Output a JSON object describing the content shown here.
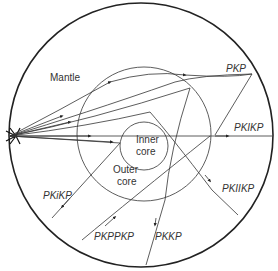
{
  "diagram": {
    "type": "seismic ray paths through Earth's interior",
    "regions": {
      "mantle": "Mantle",
      "outer_core_line1": "Outer",
      "outer_core_line2": "core",
      "inner_core_line1": "Inner",
      "inner_core_line2": "core"
    },
    "rays": {
      "pkp": "PKP",
      "pkikp": "PKIKP",
      "pkiikp": "PKIIKP",
      "pkikp_reflected": "PKiKP",
      "pkppkp": "PKPPKP",
      "pkkp": "PKKP"
    },
    "colors": {
      "line": "#222222",
      "text": "#333333",
      "background": "#ffffff"
    }
  }
}
